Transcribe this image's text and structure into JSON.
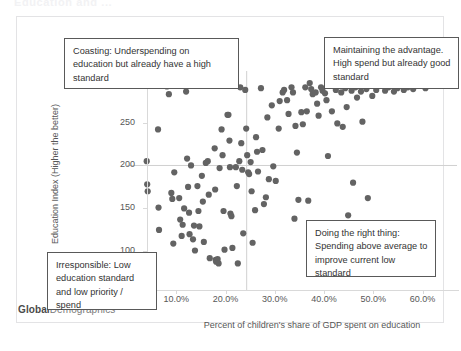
{
  "slide": {
    "title": "Education and ..."
  },
  "brand": {
    "bold_part": "Global",
    "rest_part": "Demographics"
  },
  "callouts": [
    {
      "name": "coasting",
      "text": "Coasting:  Underspending on education but already have a high standard"
    },
    {
      "name": "maintaining",
      "text": "Maintaining the advantage. High spend but already good standard"
    },
    {
      "name": "doing-the-right-thing",
      "text": "Doing the right thing: Spending above average to improve current low standard"
    },
    {
      "name": "irresponsible",
      "text": "Irresponsible: Low education standard and low priority / spend"
    }
  ],
  "chart_data": {
    "type": "scatter",
    "title": "",
    "xlabel": "Percent of children's share of GDP spent on education",
    "ylabel": "Education Index (Higher the better)",
    "xlim": [
      0.0,
      67.0
    ],
    "ylim": [
      55,
      310
    ],
    "xtick_labels": [
      "10.0%",
      "20.0%",
      "30.0%",
      "40.0%",
      "50.0%",
      "60.0%"
    ],
    "xticks": [
      10,
      20,
      30,
      40,
      50,
      60
    ],
    "ytick_labels": [
      "100",
      "150",
      "200",
      "250",
      "300"
    ],
    "yticks": [
      100,
      150,
      200,
      250,
      300
    ],
    "grid": false,
    "legend": "none",
    "marker_color": "#636363",
    "marker_size": 3.1,
    "reference_lines": [
      {
        "orientation": "horizontal",
        "value": 200,
        "color": "#d0d0d0"
      },
      {
        "orientation": "vertical",
        "value": 24.3,
        "color": "#d0d0d0"
      }
    ],
    "points": [
      [
        3.0,
        88
      ],
      [
        4.0,
        205
      ],
      [
        4.1,
        178
      ],
      [
        4.2,
        170
      ],
      [
        6.3,
        242
      ],
      [
        6.4,
        151
      ],
      [
        6.5,
        125
      ],
      [
        8.1,
        292
      ],
      [
        8.5,
        283
      ],
      [
        9.6,
        192
      ],
      [
        9.2,
        161
      ],
      [
        9.4,
        109
      ],
      [
        10.6,
        162
      ],
      [
        10.8,
        137
      ],
      [
        11.1,
        118
      ],
      [
        11.3,
        131
      ],
      [
        12.0,
        286
      ],
      [
        12.2,
        208
      ],
      [
        12.4,
        175
      ],
      [
        12.6,
        145
      ],
      [
        12.7,
        120
      ],
      [
        13.4,
        114
      ],
      [
        13.6,
        130
      ],
      [
        13.8,
        101
      ],
      [
        14.3,
        176
      ],
      [
        14.5,
        147
      ],
      [
        14.7,
        129
      ],
      [
        15.2,
        188
      ],
      [
        15.4,
        158
      ],
      [
        15.6,
        111
      ],
      [
        16.4,
        205
      ],
      [
        16.6,
        166
      ],
      [
        16.8,
        92
      ],
      [
        17.6,
        294
      ],
      [
        17.8,
        220
      ],
      [
        17.9,
        172
      ],
      [
        18.0,
        90
      ],
      [
        18.1,
        88
      ],
      [
        18.3,
        89
      ],
      [
        18.4,
        91
      ],
      [
        18.6,
        86
      ],
      [
        19.2,
        242
      ],
      [
        19.4,
        212
      ],
      [
        19.6,
        147
      ],
      [
        19.8,
        102
      ],
      [
        20.4,
        259
      ],
      [
        20.6,
        259
      ],
      [
        20.8,
        229
      ],
      [
        20.9,
        198
      ],
      [
        21.0,
        144
      ],
      [
        21.2,
        141
      ],
      [
        21.4,
        104
      ],
      [
        22.1,
        198
      ],
      [
        22.3,
        176
      ],
      [
        22.5,
        86
      ],
      [
        23.0,
        291
      ],
      [
        23.2,
        226
      ],
      [
        23.4,
        195
      ],
      [
        23.6,
        121
      ],
      [
        24.0,
        288
      ],
      [
        24.2,
        243
      ],
      [
        24.4,
        212
      ],
      [
        24.6,
        192
      ],
      [
        24.8,
        190
      ],
      [
        25.1,
        204
      ],
      [
        25.3,
        170
      ],
      [
        25.5,
        110
      ],
      [
        26.2,
        233
      ],
      [
        26.4,
        216
      ],
      [
        26.6,
        193
      ],
      [
        27.2,
        290
      ],
      [
        27.5,
        218
      ],
      [
        27.8,
        155
      ],
      [
        28.5,
        256
      ],
      [
        28.8,
        184
      ],
      [
        29.4,
        270
      ],
      [
        29.7,
        199
      ],
      [
        30.8,
        243
      ],
      [
        31.0,
        275
      ],
      [
        31.6,
        285
      ],
      [
        31.9,
        288
      ],
      [
        32.5,
        276
      ],
      [
        32.8,
        260
      ],
      [
        33.4,
        291
      ],
      [
        33.7,
        285
      ],
      [
        34.2,
        246
      ],
      [
        34.5,
        215
      ],
      [
        34.8,
        160
      ],
      [
        35.4,
        262
      ],
      [
        35.7,
        248
      ],
      [
        36.2,
        291
      ],
      [
        36.5,
        263
      ],
      [
        37.1,
        296
      ],
      [
        37.4,
        289
      ],
      [
        37.7,
        283
      ],
      [
        38.3,
        285
      ],
      [
        38.6,
        272
      ],
      [
        38.9,
        258
      ],
      [
        39.4,
        291
      ],
      [
        39.7,
        287
      ],
      [
        40.2,
        284
      ],
      [
        40.5,
        276
      ],
      [
        40.8,
        211
      ],
      [
        41.3,
        293
      ],
      [
        41.6,
        263
      ],
      [
        42.4,
        288
      ],
      [
        42.7,
        249
      ],
      [
        43.5,
        285
      ],
      [
        43.8,
        245
      ],
      [
        44.3,
        290
      ],
      [
        44.6,
        268
      ],
      [
        44.9,
        142
      ],
      [
        45.6,
        287
      ],
      [
        45.9,
        180
      ],
      [
        46.4,
        291
      ],
      [
        46.7,
        279
      ],
      [
        47.5,
        286
      ],
      [
        47.8,
        251
      ],
      [
        48.6,
        289
      ],
      [
        48.9,
        162
      ],
      [
        49.4,
        293
      ],
      [
        49.8,
        281
      ],
      [
        50.6,
        288
      ],
      [
        51.2,
        294
      ],
      [
        52.4,
        287
      ],
      [
        53.1,
        291
      ],
      [
        54.2,
        286
      ],
      [
        54.9,
        290
      ],
      [
        55.6,
        293
      ],
      [
        56.2,
        288
      ],
      [
        57.0,
        291
      ],
      [
        58.1,
        289
      ],
      [
        59.4,
        294
      ],
      [
        60.6,
        290
      ],
      [
        26.0,
        148
      ],
      [
        28.2,
        163
      ],
      [
        30.2,
        182
      ],
      [
        34.0,
        138
      ],
      [
        36.8,
        159
      ],
      [
        39.0,
        130
      ],
      [
        22.8,
        205
      ],
      [
        18.8,
        197
      ],
      [
        16.0,
        203
      ],
      [
        13.0,
        200
      ],
      [
        11.6,
        150
      ],
      [
        9.0,
        168
      ]
    ]
  }
}
